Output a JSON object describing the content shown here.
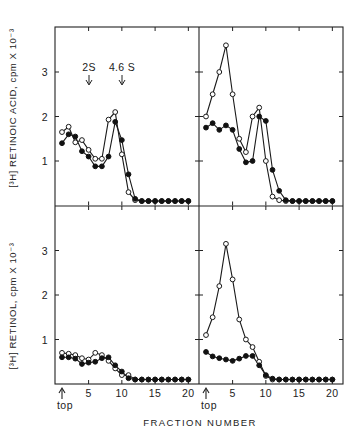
{
  "chart_data": [
    {
      "type": "line",
      "panel": "top-left",
      "title": "",
      "xlabel": "FRACTION NUMBER",
      "ylabel": "[3H] RETINOIC ACID, cpm X 10^-3",
      "x": [
        1,
        2,
        3,
        4,
        5,
        6,
        7,
        8,
        9,
        10,
        11,
        12,
        13,
        14,
        15,
        16,
        17,
        18,
        19,
        20
      ],
      "xlim": [
        0,
        22
      ],
      "ylim": [
        0,
        4
      ],
      "yticks": [
        1,
        2,
        3
      ],
      "annotations": [
        {
          "text": "2S",
          "x": 5,
          "type": "down-arrow"
        },
        {
          "text": "4.6 S",
          "x": 10,
          "type": "down-arrow"
        }
      ],
      "series": [
        {
          "name": "open-circles",
          "marker": "open",
          "values": [
            1.65,
            1.77,
            1.42,
            1.47,
            1.25,
            1.05,
            1.05,
            1.93,
            2.1,
            1.15,
            0.3,
            0.12,
            0.1,
            0.1,
            0.1,
            0.1,
            0.1,
            0.1,
            0.1,
            0.1
          ]
        },
        {
          "name": "filled-circles",
          "marker": "filled",
          "values": [
            1.4,
            1.6,
            1.55,
            1.22,
            1.1,
            0.88,
            0.88,
            1.1,
            1.88,
            1.47,
            0.7,
            0.15,
            0.1,
            0.1,
            0.1,
            0.1,
            0.1,
            0.1,
            0.1,
            0.1
          ]
        }
      ]
    },
    {
      "type": "line",
      "panel": "top-right",
      "title": "",
      "xlabel": "FRACTION NUMBER",
      "ylabel": "[3H] RETINOIC ACID, cpm X 10^-3",
      "x": [
        1,
        2,
        3,
        4,
        5,
        6,
        7,
        8,
        9,
        10,
        11,
        12,
        13,
        14,
        15,
        16,
        17,
        18,
        19,
        20
      ],
      "xlim": [
        0,
        22
      ],
      "ylim": [
        0,
        4
      ],
      "series": [
        {
          "name": "open-circles",
          "marker": "open",
          "values": [
            2.0,
            2.5,
            3.0,
            3.6,
            2.5,
            1.5,
            1.2,
            2.0,
            2.2,
            1.0,
            0.2,
            0.12,
            0.1,
            0.1,
            0.1,
            0.1,
            0.1,
            0.1,
            0.1,
            0.1
          ]
        },
        {
          "name": "filled-circles",
          "marker": "filled",
          "values": [
            1.75,
            1.85,
            1.7,
            1.8,
            1.7,
            1.27,
            0.97,
            1.0,
            2.0,
            1.9,
            0.8,
            0.33,
            0.12,
            0.1,
            0.1,
            0.1,
            0.1,
            0.1,
            0.1,
            0.1
          ]
        }
      ]
    },
    {
      "type": "line",
      "panel": "bottom-left",
      "title": "",
      "xlabel": "FRACTION NUMBER",
      "ylabel": "[3H] RETINOL, cpm X 10^-3",
      "x": [
        1,
        2,
        3,
        4,
        5,
        6,
        7,
        8,
        9,
        10,
        11,
        12,
        13,
        14,
        15,
        16,
        17,
        18,
        19,
        20
      ],
      "xlim": [
        0,
        22
      ],
      "ylim": [
        0,
        4
      ],
      "yticks": [
        1,
        2,
        3
      ],
      "xticks": [
        {
          "value": 1,
          "label": "top",
          "arrow": true
        },
        {
          "value": 5,
          "label": "5"
        },
        {
          "value": 10,
          "label": "10"
        },
        {
          "value": 15,
          "label": "15"
        },
        {
          "value": 20,
          "label": "20"
        }
      ],
      "series": [
        {
          "name": "open-circles",
          "marker": "open",
          "values": [
            0.7,
            0.68,
            0.65,
            0.58,
            0.55,
            0.7,
            0.65,
            0.52,
            0.35,
            0.2,
            0.2,
            0.1,
            0.1,
            0.1,
            0.1,
            0.1,
            0.1,
            0.1,
            0.1,
            0.1
          ]
        },
        {
          "name": "filled-circles",
          "marker": "filled",
          "values": [
            0.6,
            0.6,
            0.57,
            0.45,
            0.48,
            0.5,
            0.58,
            0.6,
            0.42,
            0.28,
            0.13,
            0.1,
            0.1,
            0.1,
            0.1,
            0.1,
            0.1,
            0.1,
            0.1,
            0.1
          ]
        }
      ]
    },
    {
      "type": "line",
      "panel": "bottom-right",
      "title": "",
      "xlabel": "FRACTION NUMBER",
      "ylabel": "[3H] RETINOL, cpm X 10^-3",
      "x": [
        1,
        2,
        3,
        4,
        5,
        6,
        7,
        8,
        9,
        10,
        11,
        12,
        13,
        14,
        15,
        16,
        17,
        18,
        19,
        20
      ],
      "xlim": [
        0,
        22
      ],
      "ylim": [
        0,
        4
      ],
      "xticks": [
        {
          "value": 1,
          "label": "top",
          "arrow": true
        },
        {
          "value": 5,
          "label": "5"
        },
        {
          "value": 10,
          "label": "10"
        },
        {
          "value": 15,
          "label": "15"
        },
        {
          "value": 20,
          "label": "20"
        }
      ],
      "series": [
        {
          "name": "open-circles",
          "marker": "open",
          "values": [
            1.1,
            1.5,
            2.2,
            3.15,
            2.35,
            1.45,
            1.0,
            0.83,
            0.5,
            0.18,
            0.1,
            0.1,
            0.1,
            0.1,
            0.1,
            0.1,
            0.1,
            0.1,
            0.1,
            0.1
          ]
        },
        {
          "name": "filled-circles",
          "marker": "filled",
          "values": [
            0.72,
            0.62,
            0.58,
            0.55,
            0.52,
            0.57,
            0.63,
            0.63,
            0.42,
            0.2,
            0.12,
            0.1,
            0.1,
            0.1,
            0.1,
            0.1,
            0.1,
            0.1,
            0.1,
            0.1
          ]
        }
      ]
    }
  ],
  "labels": {
    "ylabel_top": "[³H] RETINOIC ACID, cpm X 10⁻³",
    "ylabel_bottom": "[³H] RETINOL, cpm X 10⁻³",
    "xlabel": "FRACTION NUMBER",
    "annot_2s": "2S",
    "annot_46s": "4.6 S",
    "top_marker": "top",
    "yticks": [
      "1",
      "2",
      "3"
    ],
    "xticks": [
      "5",
      "10",
      "15",
      "20"
    ]
  }
}
